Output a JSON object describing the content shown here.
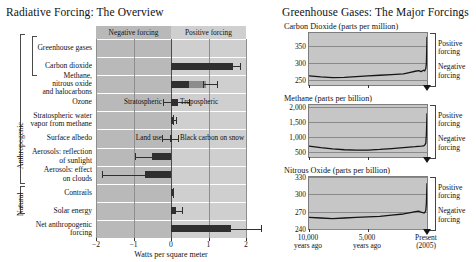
{
  "left": {
    "title": "Radiative Forcing: The Overview",
    "header_negative": "Negative forcing",
    "header_positive": "Positive forcing",
    "axis_title": "Watts per square meter",
    "group_labels": {
      "anthropogenic": "Anthropogenic",
      "natural": "Natural"
    },
    "xticks": [
      "−2",
      "−1",
      "0",
      "1",
      "2"
    ],
    "annotations": [
      {
        "text": "Stratospheric",
        "row": "ozone",
        "side": "left"
      },
      {
        "text": "Tropospheric",
        "row": "ozone",
        "side": "right"
      },
      {
        "text": "Land use",
        "row": "surface-albedo",
        "side": "left"
      },
      {
        "text": "Black carbon on snow",
        "row": "surface-albedo",
        "side": "right"
      }
    ],
    "rows": [
      {
        "name": "greenhouse-gases",
        "label": "Greenhouse gases",
        "value": null,
        "low": null,
        "high": null
      },
      {
        "name": "carbon-dioxide",
        "label": "Carbon dioxide",
        "value": 1.66,
        "low": 1.49,
        "high": 1.83
      },
      {
        "name": "methane-n2o-halocarbons",
        "label": "Methane,\nnitrous oxide\nand halocarbons",
        "value": 0.92,
        "low": 0.86,
        "high": 1.22
      },
      {
        "name": "ozone",
        "label": "Ozone",
        "value": 0.18,
        "low": -0.22,
        "high": 0.47
      },
      {
        "name": "stratospheric-water-vapor",
        "label": "Stratospheric water\nvapor from methane",
        "value": 0.07,
        "low": 0.02,
        "high": 0.12
      },
      {
        "name": "surface-albedo",
        "label": "Surface albedo",
        "value": -0.04,
        "low": -0.25,
        "high": 0.18
      },
      {
        "name": "aerosols-reflection",
        "label": "Aerosols: reflection\nof sunlight",
        "value": -0.5,
        "low": -0.95,
        "high": -0.1
      },
      {
        "name": "aerosols-clouds",
        "label": "Aerosols: effect\non clouds",
        "value": -0.7,
        "low": -1.85,
        "high": -0.3
      },
      {
        "name": "contrails",
        "label": "Contrails",
        "value": 0.01,
        "low": 0.003,
        "high": 0.03
      },
      {
        "name": "solar-energy",
        "label": "Solar energy",
        "value": 0.12,
        "low": 0.06,
        "high": 0.3
      },
      {
        "name": "net-anthropogenic",
        "label": "Net anthropogenic\nforcing",
        "value": 1.6,
        "low": 0.6,
        "high": 2.4
      }
    ]
  },
  "right": {
    "title": "Greenhouse Gases: The Major Forcings",
    "forcing_positive": "Positive\nforcing",
    "forcing_negative": "Negative\nforcing",
    "xlabels": [
      "10,000\nyears ago",
      "5,000\nyears ago",
      "Present\n(2005)"
    ],
    "charts": [
      {
        "name": "carbon-dioxide-chart",
        "title": "Carbon Dioxide (parts per million)",
        "yticks": [
          250,
          300,
          350
        ],
        "ylim": [
          235,
          390
        ]
      },
      {
        "name": "methane-chart",
        "title": "Methane (parts per billion)",
        "yticks": [
          500,
          1000,
          1500,
          2000
        ],
        "ytick_labels": [
          "500",
          "1,000",
          "1,500",
          "2,000"
        ],
        "ylim": [
          330,
          2050
        ]
      },
      {
        "name": "nitrous-oxide-chart",
        "title": "Nitrous Oxide (parts per billion)",
        "yticks": [
          240,
          270,
          300,
          330
        ],
        "ylim": [
          240,
          330
        ]
      }
    ]
  },
  "chart_data": [
    {
      "type": "bar",
      "name": "radiative-forcing-overview",
      "title": "Radiative Forcing: The Overview",
      "xlabel": "Watts per square meter",
      "ylabel": "",
      "orientation": "horizontal",
      "xlim": [
        -2,
        2
      ],
      "xticks": [
        -2,
        -1,
        0,
        1,
        2
      ],
      "grid": true,
      "categories": [
        "Carbon dioxide",
        "Methane, nitrous oxide and halocarbons",
        "Ozone",
        "Stratospheric water vapor from methane",
        "Surface albedo",
        "Aerosols: reflection of sunlight",
        "Aerosols: effect on clouds",
        "Contrails",
        "Solar energy",
        "Net anthropogenic forcing"
      ],
      "values": [
        1.66,
        0.92,
        0.18,
        0.07,
        -0.04,
        -0.5,
        -0.7,
        0.01,
        0.12,
        1.6
      ],
      "error_low": [
        1.49,
        0.86,
        -0.22,
        0.02,
        -0.25,
        -0.95,
        -1.85,
        0.003,
        0.06,
        0.6
      ],
      "error_high": [
        1.83,
        1.22,
        0.47,
        0.12,
        0.18,
        -0.1,
        -0.3,
        0.03,
        0.3,
        2.4
      ],
      "groups": {
        "Anthropogenic": [
          0,
          7
        ],
        "Natural": [
          8,
          8
        ]
      },
      "annotations": [
        "Negative forcing",
        "Positive forcing",
        "Stratospheric",
        "Tropospheric",
        "Land use",
        "Black carbon on snow"
      ]
    },
    {
      "type": "line",
      "name": "carbon-dioxide-concentration",
      "title": "Carbon Dioxide (parts per million)",
      "xlabel": "",
      "ylabel": "parts per million",
      "xlim": [
        -10000,
        0
      ],
      "ylim": [
        235,
        390
      ],
      "yticks": [
        250,
        300,
        350
      ],
      "xticks": [
        -10000,
        -5000,
        0
      ],
      "xtick_labels": [
        "10,000 years ago",
        "5,000 years ago",
        "Present (2005)"
      ],
      "grid": true,
      "x": [
        -10000,
        -9000,
        -8000,
        -7000,
        -6000,
        -5000,
        -4000,
        -3000,
        -2000,
        -1500,
        -1000,
        -700,
        -500,
        -300,
        -200,
        -100,
        -50,
        0
      ],
      "y": [
        262,
        259,
        257,
        258,
        260,
        262,
        264,
        266,
        268,
        272,
        276,
        278,
        275,
        279,
        277,
        284,
        300,
        379
      ]
    },
    {
      "type": "line",
      "name": "methane-concentration",
      "title": "Methane (parts per billion)",
      "xlabel": "",
      "ylabel": "parts per billion",
      "xlim": [
        -10000,
        0
      ],
      "ylim": [
        330,
        2050
      ],
      "yticks": [
        500,
        1000,
        1500,
        2000
      ],
      "xticks": [
        -10000,
        -5000,
        0
      ],
      "xtick_labels": [
        "10,000 years ago",
        "5,000 years ago",
        "Present (2005)"
      ],
      "grid": true,
      "x": [
        -10000,
        -9000,
        -8000,
        -7000,
        -6000,
        -5000,
        -4000,
        -3000,
        -2000,
        -1000,
        -500,
        -300,
        -200,
        -100,
        -50,
        0
      ],
      "y": [
        690,
        640,
        600,
        570,
        560,
        560,
        580,
        610,
        640,
        670,
        690,
        700,
        720,
        790,
        1100,
        1775
      ]
    },
    {
      "type": "line",
      "name": "nitrous-oxide-concentration",
      "title": "Nitrous Oxide (parts per billion)",
      "xlabel": "",
      "ylabel": "parts per billion",
      "xlim": [
        -10000,
        0
      ],
      "ylim": [
        240,
        330
      ],
      "yticks": [
        240,
        270,
        300,
        330
      ],
      "xticks": [
        -10000,
        -5000,
        0
      ],
      "xtick_labels": [
        "10,000 years ago",
        "5,000 years ago",
        "Present (2005)"
      ],
      "grid": true,
      "x": [
        -10000,
        -9000,
        -8000,
        -7000,
        -6000,
        -5000,
        -4000,
        -3000,
        -2000,
        -1500,
        -1000,
        -700,
        -500,
        -300,
        -200,
        -100,
        -50,
        0
      ],
      "y": [
        260,
        259,
        258,
        259,
        260,
        261,
        262,
        264,
        266,
        268,
        270,
        271,
        269,
        268,
        268,
        272,
        285,
        319
      ]
    }
  ]
}
